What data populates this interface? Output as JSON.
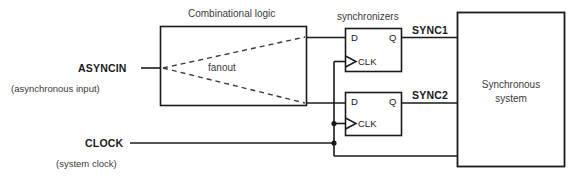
{
  "diagram": {
    "colors": {
      "background": "#ffffff",
      "wire": "#1a1a1a",
      "box_border": "#1a1a1a",
      "dashed_fanout": "#3a3a3a",
      "text_bold": "#1a1a1a",
      "text_plain": "#3a3a3a"
    },
    "labels": {
      "combinational_logic": "Combinational logic",
      "fanout": "fanout",
      "synchronizers": "synchronizers",
      "asyncin": "ASYNCIN",
      "asyncin_note": "(asynchronous input)",
      "clock": "CLOCK",
      "clock_note": "(system clock)",
      "sync1": "SYNC1",
      "sync2": "SYNC2",
      "synchronous_system_line1": "Synchronous",
      "synchronous_system_line2": "system"
    },
    "flipflops": [
      {
        "name": "synchronizer-ff-1",
        "d_pin": "D",
        "q_pin": "Q",
        "clk_pin": "CLK",
        "output_label": "SYNC1"
      },
      {
        "name": "synchronizer-ff-2",
        "d_pin": "D",
        "q_pin": "Q",
        "clk_pin": "CLK",
        "output_label": "SYNC2"
      }
    ],
    "blocks": [
      {
        "name": "combinational-logic-block",
        "label": "Combinational logic"
      },
      {
        "name": "synchronous-system-block",
        "label": "Synchronous system"
      }
    ],
    "signals": [
      {
        "name": "ASYNCIN",
        "description": "(asynchronous input)"
      },
      {
        "name": "CLOCK",
        "description": "(system clock)"
      },
      {
        "name": "SYNC1",
        "description": ""
      },
      {
        "name": "SYNC2",
        "description": ""
      }
    ]
  }
}
